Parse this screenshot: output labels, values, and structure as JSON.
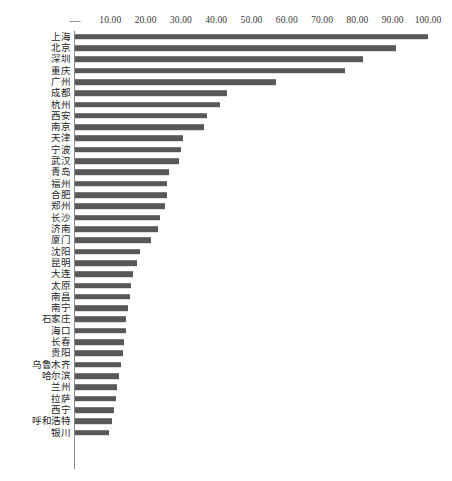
{
  "chart_data": {
    "type": "bar",
    "orientation": "horizontal",
    "title": "",
    "subtitle": "",
    "xlabel": "",
    "ylabel": "",
    "xlim": [
      0,
      100
    ],
    "grid": false,
    "legend": null,
    "axis_position": "top",
    "bar_color": "#58585a",
    "axis_color": "#8a8a8a",
    "x_tick_labels": [
      "—",
      "10.00",
      "20.00",
      "30.00",
      "40.00",
      "50.00",
      "60.00",
      "70.00",
      "80.00",
      "90.00",
      "100.00"
    ],
    "x_tick_values": [
      0,
      10,
      20,
      30,
      40,
      50,
      60,
      70,
      80,
      90,
      100
    ],
    "categories": [
      "上海",
      "北京",
      "深圳",
      "重庆",
      "广州",
      "成都",
      "杭州",
      "西安",
      "南京",
      "天津",
      "宁波",
      "武汉",
      "青岛",
      "福州",
      "合肥",
      "郑州",
      "长沙",
      "济南",
      "厦门",
      "沈阳",
      "昆明",
      "大连",
      "太原",
      "南昌",
      "南宁",
      "石家庄",
      "海口",
      "长春",
      "贵阳",
      "乌鲁木齐",
      "哈尔滨",
      "兰州",
      "拉萨",
      "西宁",
      "呼和浩特",
      "银川"
    ],
    "values": [
      100.0,
      91.0,
      81.5,
      76.5,
      57.0,
      43.0,
      41.0,
      37.5,
      36.5,
      30.5,
      30.0,
      29.5,
      26.5,
      26.0,
      26.0,
      25.5,
      24.0,
      23.5,
      21.5,
      18.5,
      17.5,
      16.5,
      16.0,
      15.5,
      15.0,
      14.5,
      14.5,
      14.0,
      13.5,
      13.0,
      12.5,
      12.0,
      11.5,
      11.0,
      10.5,
      9.5
    ]
  }
}
